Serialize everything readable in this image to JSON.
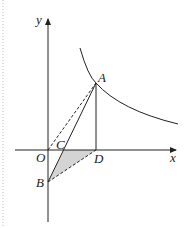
{
  "diagram": {
    "axes": {
      "x_label": "x",
      "y_label": "y",
      "origin_label": "O"
    },
    "points": {
      "A": {
        "label": "A"
      },
      "B": {
        "label": "B"
      },
      "C": {
        "label": "C"
      },
      "D": {
        "label": "D"
      },
      "O": {
        "label": "O"
      }
    },
    "curve": "hyperbola in first quadrant",
    "colors": {
      "stroke": "#222222",
      "shade": "#d4d4d4",
      "border": "#bbbbbb"
    }
  }
}
